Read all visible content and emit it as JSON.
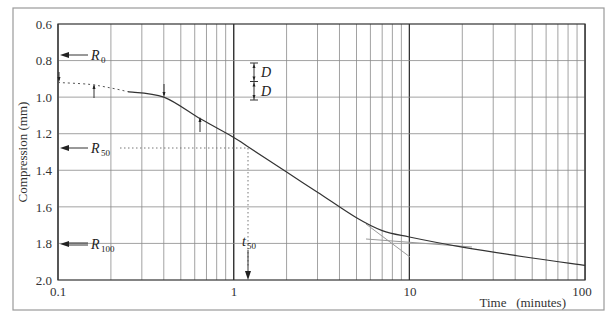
{
  "chart_data": {
    "type": "line",
    "title": "",
    "xlabel": "Time   (minutes)",
    "ylabel": "Compression (mm)",
    "x_scale": "log",
    "xlim": [
      0.1,
      100
    ],
    "ylim": [
      2.0,
      0.6
    ],
    "y_inverted": true,
    "grid": true,
    "x_ticks": [
      "0.1",
      "1",
      "10",
      "100"
    ],
    "y_ticks": [
      "0.6",
      "0.8",
      "1.0",
      "1.2",
      "1.4",
      "1.6",
      "1.8",
      "2.0"
    ],
    "series": [
      {
        "name": "Compression curve",
        "style": "solid",
        "x": [
          0.25,
          0.4,
          0.65,
          1,
          1.2,
          2,
          3,
          5,
          7,
          10,
          20,
          50,
          100
        ],
        "y": [
          0.97,
          1.0,
          1.12,
          1.22,
          1.27,
          1.41,
          1.52,
          1.66,
          1.73,
          1.765,
          1.82,
          1.88,
          1.92
        ]
      },
      {
        "name": "Extrapolated initial portion",
        "style": "dotted",
        "x": [
          0.1,
          0.15,
          0.2,
          0.25
        ],
        "y": [
          0.92,
          0.93,
          0.95,
          0.97
        ]
      },
      {
        "name": "Tangent to primary consolidation",
        "style": "thin",
        "x": [
          5,
          10
        ],
        "y": [
          1.66,
          1.84
        ]
      },
      {
        "name": "Tangent to secondary compression",
        "style": "thin",
        "x": [
          6,
          20
        ],
        "y": [
          1.78,
          1.82
        ]
      }
    ],
    "annotations": [
      {
        "text": "R0",
        "y": 0.8,
        "type": "arrow-label"
      },
      {
        "text": "R50",
        "y": 1.27,
        "type": "arrow-label"
      },
      {
        "text": "R100",
        "y": 1.79,
        "type": "arrow-label"
      },
      {
        "text": "t50",
        "x": 1.2,
        "type": "arrow-label"
      },
      {
        "text": "D",
        "type": "dimension",
        "from": 0.85,
        "to": 0.95
      },
      {
        "text": "D",
        "type": "dimension",
        "from": 0.95,
        "to": 1.05
      }
    ]
  },
  "labels": {
    "y_ticks": [
      "0.6",
      "0.8",
      "1.0",
      "1.2",
      "1.4",
      "1.6",
      "1.8",
      "2.0"
    ],
    "x_ticks": [
      "0.1",
      "1",
      "10",
      "100"
    ],
    "xlabel": "Time   (minutes)",
    "ylabel": "Compression (mm)",
    "r0": "R",
    "r0_sub": "0",
    "r50": "R",
    "r50_sub": "50",
    "r100": "R",
    "r100_sub": "100",
    "t50": "t",
    "t50_sub": "50",
    "d1": "D",
    "d2": "D"
  }
}
